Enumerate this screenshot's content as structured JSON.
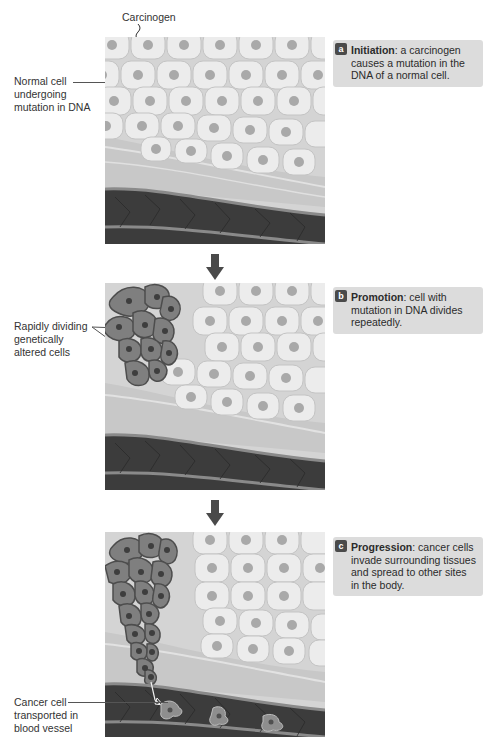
{
  "figure": {
    "colors": {
      "panel_bg": "#d9d9d9",
      "normal_cell": "#ececec",
      "cell_nucleus": "#a8a8a8",
      "cancer_cell": "#7f7f7f",
      "cancer_outline": "#4d4d4d",
      "tissue": "#c9c9c9",
      "vessel": "#3a3a3a",
      "callout_bg": "#dcdcdc",
      "badge_bg": "#4a4a4a",
      "arrow": "#4a4a4a"
    }
  },
  "panels": [
    {
      "id": "a",
      "stage": "Initiation",
      "description": ": a carcinogen causes a mutation in the DNA of a normal cell.",
      "labels": {
        "top": "Carcinogen",
        "left": "Normal cell undergoing mutation in DNA"
      }
    },
    {
      "id": "b",
      "stage": "Promotion",
      "description": ": cell with mutation in DNA divides repeatedly.",
      "labels": {
        "left": "Rapidly dividing genetically altered cells"
      }
    },
    {
      "id": "c",
      "stage": "Progression",
      "description": ": cancer cells invade surrounding tissues and spread to other sites in the body.",
      "labels": {
        "left": "Cancer cell transported in blood vessel"
      }
    }
  ]
}
